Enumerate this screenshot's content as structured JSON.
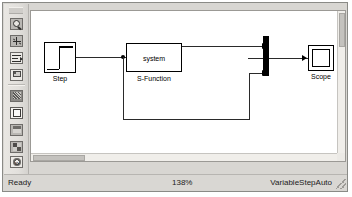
{
  "window": {
    "title": "Simulink Model Window"
  },
  "toolbar": {
    "items": [
      {
        "name": "zoom-icon",
        "label": "Zoom"
      },
      {
        "name": "fit-to-view-icon",
        "label": "Fit To View"
      },
      {
        "name": "alignment-icon",
        "label": "Alignment"
      },
      {
        "name": "model-explorer-icon",
        "label": "Model Explorer"
      },
      {
        "name": "library-browser-icon",
        "label": "Library Browser"
      },
      {
        "name": "new-model-icon",
        "label": "New Model"
      },
      {
        "name": "snapshot-icon",
        "label": "Snapshot"
      },
      {
        "name": "block-parameters-icon",
        "label": "Block Parameters"
      },
      {
        "name": "settings-gear-icon",
        "label": "Model Configuration"
      }
    ],
    "overflow_label": "»"
  },
  "canvas": {
    "blocks": [
      {
        "id": "step",
        "kind": "step",
        "label": "Step",
        "inner_text": "",
        "x": 40,
        "y": 54,
        "w": 32,
        "h": 31
      },
      {
        "id": "s-function",
        "kind": "sfunction",
        "label": "S-Function",
        "inner_text": "system",
        "x": 122,
        "y": 55,
        "w": 56,
        "h": 29
      },
      {
        "id": "mux",
        "kind": "mux",
        "label": "",
        "inner_text": "",
        "x": 238,
        "y": 58,
        "w": 6,
        "h": 40
      },
      {
        "id": "scope",
        "kind": "scope",
        "label": "Scope",
        "inner_text": "",
        "x": 304,
        "y": 61,
        "w": 26,
        "h": 26
      }
    ],
    "signal_count": 4
  },
  "scrollbars": {
    "vertical_label": "vertical-scrollbar",
    "horizontal_label": "horizontal-scrollbar"
  },
  "statusbar": {
    "status": "Ready",
    "zoom": "138%",
    "solver": "VariableStepAuto"
  },
  "colors": {
    "chrome": "#d8d6d2",
    "canvas": "#ffffff",
    "wire": "#2a2a2a",
    "block_border": "#000000",
    "mux_fill": "#000000"
  }
}
